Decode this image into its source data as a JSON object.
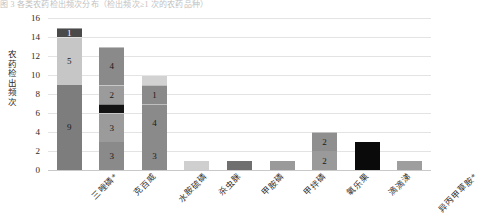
{
  "top_caption": "图 3 各类农药检出频次分布（检出频次≥1 次的农药品种）",
  "chart_data": {
    "type": "bar",
    "title": "",
    "subtitle": "",
    "xlabel": "",
    "ylabel": "农药检出频次",
    "ylim": [
      0,
      16
    ],
    "yticks": [
      0,
      2,
      4,
      6,
      8,
      10,
      12,
      14,
      16
    ],
    "ytick_labels": [
      "0",
      "2",
      "4",
      "6",
      "8",
      "10",
      "12",
      "14",
      "16"
    ],
    "grid": true,
    "legend": "none",
    "stacked": true,
    "categories": [
      "三唑磷*",
      "克百威",
      "水胺硫磷",
      "杀虫脒",
      "甲胺磷",
      "甲拌磷",
      "氧乐果",
      "滴滴涕",
      "异丙甲草胺*"
    ],
    "series": [
      {
        "name": "层1",
        "values": [
          9,
          3,
          3,
          1,
          1,
          2,
          3,
          1,
          0
        ],
        "color": "#808080"
      },
      {
        "name": "层2",
        "values": [
          5,
          3,
          4,
          0,
          0,
          2,
          0,
          0,
          0
        ],
        "color": "#bfbfbf"
      },
      {
        "name": "层3",
        "values": [
          1,
          1,
          1,
          0,
          0,
          0,
          0,
          0,
          0
        ],
        "color": "#404040"
      },
      {
        "name": "层4",
        "values": [
          0,
          2,
          1,
          0,
          0,
          0,
          0,
          0,
          0
        ],
        "color": "#a6a6a6"
      },
      {
        "name": "层5",
        "values": [
          0,
          4,
          1,
          0,
          0,
          0,
          0,
          0,
          0
        ],
        "color": "#8c8c8c"
      }
    ],
    "bars": [
      {
        "category": "三唑磷*",
        "total": 15,
        "segments": [
          {
            "value": 9,
            "label": "9",
            "color": "#7d7d7d",
            "label_color": "#1a1a1a"
          },
          {
            "value": 5,
            "label": "5",
            "color": "#c6c6c6",
            "label_color": "#1a1a1a"
          },
          {
            "value": 1,
            "label": "1",
            "color": "#4a4a4a",
            "label_color": "#ffffff"
          }
        ]
      },
      {
        "category": "克百威",
        "total": 13,
        "segments": [
          {
            "value": 3,
            "label": "3",
            "color": "#8a8a8a",
            "label_color": "#1a1a1a"
          },
          {
            "value": 3,
            "label": "3",
            "color": "#9b9b9b",
            "label_color": "#1a1a1a"
          },
          {
            "value": 1,
            "label": "",
            "color": "#141414",
            "label_color": "#ffffff"
          },
          {
            "value": 2,
            "label": "2",
            "color": "#9b9b9b",
            "label_color": "#1a1a1a"
          },
          {
            "value": 4,
            "label": "4",
            "color": "#8a8a8a",
            "label_color": "#1a1a1a"
          }
        ]
      },
      {
        "category": "水胺硫磷",
        "total": 10,
        "segments": [
          {
            "value": 3,
            "label": "3",
            "color": "#8a8a8a",
            "label_color": "#1a1a1a"
          },
          {
            "value": 4,
            "label": "4",
            "color": "#8a8a8a",
            "label_color": "#1a1a1a"
          },
          {
            "value": 2,
            "label": "1",
            "color": "#8a8a8a",
            "label_color": "#1a1a1a"
          },
          {
            "value": 1,
            "label": "",
            "color": "#d2d2d2",
            "label_color": "#1a1a1a"
          }
        ]
      },
      {
        "category": "杀虫脒",
        "total": 1,
        "segments": [
          {
            "value": 1,
            "label": "",
            "color": "#cfcfcf",
            "label_color": "#1a1a1a"
          }
        ]
      },
      {
        "category": "甲胺磷",
        "total": 1,
        "segments": [
          {
            "value": 1,
            "label": "",
            "color": "#6f6f6f",
            "label_color": "#ffffff"
          }
        ]
      },
      {
        "category": "甲拌磷",
        "total": 1,
        "segments": [
          {
            "value": 1,
            "label": "",
            "color": "#9a9a9a",
            "label_color": "#1a1a1a"
          }
        ]
      },
      {
        "category": "氧乐果",
        "total": 4,
        "segments": [
          {
            "value": 2,
            "label": "2",
            "color": "#9a9a9a",
            "label_color": "#1a1a1a"
          },
          {
            "value": 2,
            "label": "2",
            "color": "#8f8f8f",
            "label_color": "#1a1a1a"
          }
        ]
      },
      {
        "category": "滴滴涕",
        "total": 3,
        "segments": [
          {
            "value": 3,
            "label": "",
            "color": "#0a0a0a",
            "label_color": "#ffffff"
          }
        ]
      },
      {
        "category": "异丙甲草胺*",
        "total": 1,
        "segments": [
          {
            "value": 1,
            "label": "",
            "color": "#9e9e9e",
            "label_color": "#1a1a1a"
          }
        ]
      }
    ]
  },
  "colors": {
    "gridline": "#e3e3e3",
    "baseline": "#c9c9c9",
    "text": "#2b2b2b",
    "background": "#ffffff"
  }
}
